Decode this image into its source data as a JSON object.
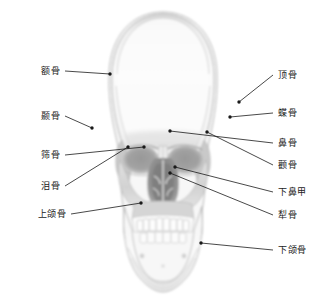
{
  "figure": {
    "type": "anatomical-radiograph-diagram",
    "style": "grayscale radiograph",
    "background_color": "#ffffff",
    "leader_color": "#1a1a1a",
    "text_color": "#1a1a1a"
  },
  "labels_left": [
    {
      "text": "额骨",
      "label_x": 60,
      "label_y": 71,
      "point_x": 110,
      "point_y": 74
    },
    {
      "text": "颞骨",
      "label_x": 60,
      "label_y": 116,
      "point_x": 92,
      "point_y": 128
    },
    {
      "text": "筛骨",
      "label_x": 60,
      "label_y": 155,
      "point_x": 144,
      "point_y": 147
    },
    {
      "text": "泪骨",
      "label_x": 60,
      "label_y": 186,
      "point_x": 128,
      "point_y": 147
    },
    {
      "text": "上颌骨",
      "label_x": 66,
      "label_y": 214,
      "point_x": 141,
      "point_y": 203
    }
  ],
  "labels_right": [
    {
      "text": "顶骨",
      "label_x": 278,
      "label_y": 75,
      "point_x": 239,
      "point_y": 102
    },
    {
      "text": "蝶骨",
      "label_x": 278,
      "label_y": 113,
      "point_x": 230,
      "point_y": 117
    },
    {
      "text": "鼻骨",
      "label_x": 278,
      "label_y": 143,
      "point_x": 170,
      "point_y": 131
    },
    {
      "text": "颧骨",
      "label_x": 278,
      "label_y": 165,
      "point_x": 207,
      "point_y": 132
    },
    {
      "text": "下鼻甲",
      "label_x": 278,
      "label_y": 192,
      "point_x": 175,
      "point_y": 167
    },
    {
      "text": "犁骨",
      "label_x": 278,
      "label_y": 215,
      "point_x": 170,
      "point_y": 173
    },
    {
      "text": "下颌骨",
      "label_x": 278,
      "label_y": 250,
      "point_x": 201,
      "point_y": 243
    }
  ]
}
